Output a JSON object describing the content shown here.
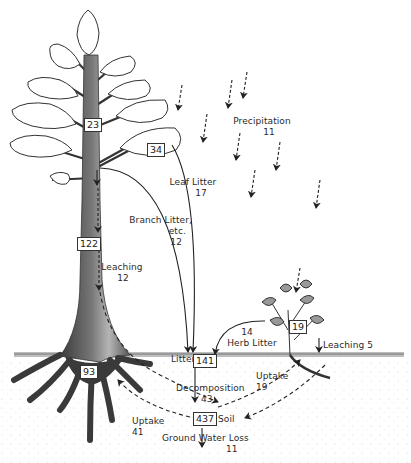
{
  "diagram": {
    "type": "nutrient-cycle",
    "compartments": {
      "tree_leaves": "23",
      "leaf_cluster": "34",
      "trunk": "122",
      "roots": "93",
      "herb": "19",
      "litter": {
        "label": "Litter",
        "value": "141"
      },
      "soil": {
        "label": "Soil",
        "value": "437"
      }
    },
    "flows": {
      "precipitation": {
        "label": "Precipitation",
        "value": "11"
      },
      "leaf_litter": {
        "label": "Leaf  Litter",
        "value": "17"
      },
      "branch_litter": {
        "label_line1": "Branch  Litter,",
        "label_line2": "etc.",
        "value": "12"
      },
      "leaching_tree": {
        "label": "Leaching",
        "value": "12"
      },
      "herb_litter": {
        "value": "14",
        "label": "Herb  Litter"
      },
      "leaching_herb": {
        "label": "Leaching 5"
      },
      "decomposition": {
        "label": "Decomposition",
        "value": "43"
      },
      "uptake_herb": {
        "label": "Uptake",
        "value": "19"
      },
      "uptake_tree": {
        "label": "Uptake",
        "value": "41"
      },
      "ground_water_loss": {
        "label": "Ground  Water  Loss",
        "value": "11"
      }
    },
    "colors": {
      "line": "#222222",
      "trunk_dark": "#2e2e2e",
      "trunk_light": "#9a9a9a",
      "soil_dots": "#c8c8c8",
      "ground": "#8a8a8a"
    }
  }
}
